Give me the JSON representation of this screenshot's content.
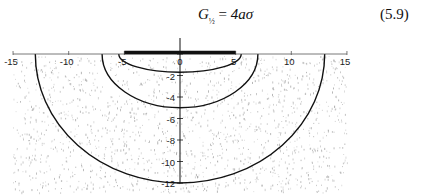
{
  "equation": {
    "lhs_symbol": "G",
    "lhs_subscript": "½",
    "equals": "=",
    "rhs": "4aσ",
    "number": "(5.9)"
  },
  "chart_data": {
    "type": "diagram",
    "title": "",
    "x_axis": {
      "range": [
        -15,
        15
      ],
      "ticks": [
        -15,
        -10,
        -5,
        0,
        5,
        10,
        15
      ],
      "tick_labels": [
        "-15",
        "-10",
        "-5",
        "0",
        "5",
        "10",
        "15"
      ]
    },
    "y_axis": {
      "range": [
        -12,
        0
      ],
      "ticks": [
        0,
        -2,
        -4,
        -6,
        -8,
        -10,
        -12
      ],
      "tick_labels": [
        "0",
        "-2",
        "-4",
        "-6",
        "-8",
        "-10",
        "-12"
      ]
    },
    "footing": {
      "x_from": -5,
      "x_to": 5,
      "y": 0
    },
    "contours": [
      {
        "name": "inner",
        "x_half_width": 5.5,
        "depth": -1.7
      },
      {
        "name": "middle",
        "x_half_width": 7,
        "depth": -5
      },
      {
        "name": "outer",
        "x_half_width": 13,
        "depth": -12
      }
    ],
    "background": "stippled soil"
  },
  "colors": {
    "ink": "#111111",
    "axis": "#555555",
    "stipple": "#9a9a9a"
  }
}
